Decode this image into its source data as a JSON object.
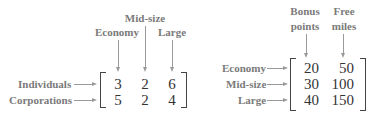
{
  "left_matrix": {
    "column_labels": [
      "Economy",
      "Mid-size",
      "Large"
    ],
    "row_labels": [
      "Individuals",
      "Corporations"
    ],
    "rows": [
      [
        "3",
        "2",
        "6"
      ],
      [
        "5",
        "2",
        "4"
      ]
    ]
  },
  "right_matrix": {
    "column_labels": [
      {
        "line1": "Bonus",
        "line2": "points"
      },
      {
        "line1": "Free",
        "line2": "miles"
      }
    ],
    "row_labels": [
      "Economy",
      "Mid-size",
      "Large"
    ],
    "rows": [
      [
        "20",
        "50"
      ],
      [
        "30",
        "100"
      ],
      [
        "40",
        "150"
      ]
    ]
  },
  "colors": {
    "label": "#7a7a7a",
    "arrow": "#9a9a9a",
    "numbers": "#333333",
    "bracket": "#444444"
  }
}
